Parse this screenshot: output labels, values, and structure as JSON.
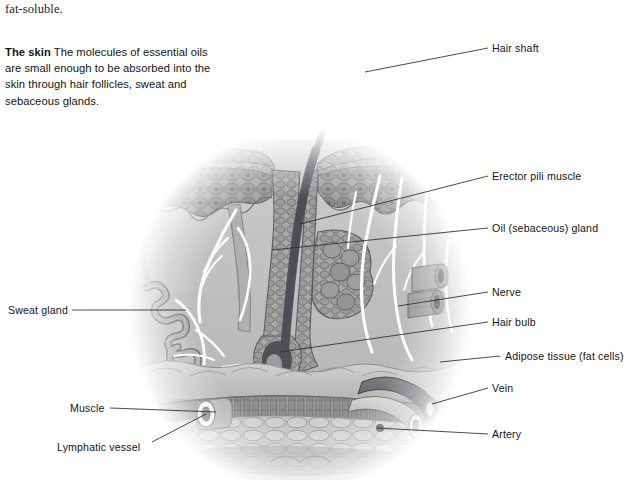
{
  "page": {
    "continuation_text": "fat-soluble.",
    "background_color": "#ffffff",
    "ink_color": "#141414"
  },
  "body_paragraph": {
    "lead_in": "The skin",
    "text": " The molecules of essential oils are small enough to be absorbed into the skin through hair follicles, sweat and sebaceous glands."
  },
  "figure": {
    "style": "grayscale medical illustration, circular vignette fading to white",
    "palette": {
      "epidermis_cells": "#8d8d8d",
      "dermis": "#b9b9b9",
      "hair_shaft": "#4f5055",
      "vessel_dark": "#5a5c61",
      "vessel_light": "#aeaeae",
      "nerve_white": "#fdfdfd",
      "muscle": "#9a9a9a",
      "adipose": "#c6c6c6"
    }
  },
  "labels": {
    "right": [
      {
        "id": "hair-shaft",
        "text": "Hair shaft"
      },
      {
        "id": "erector-pili",
        "text": "Erector pili muscle"
      },
      {
        "id": "oil-gland",
        "text": "Oil (sebaceous) gland"
      },
      {
        "id": "nerve",
        "text": "Nerve"
      },
      {
        "id": "hair-bulb",
        "text": "Hair bulb"
      },
      {
        "id": "adipose",
        "text": "Adipose tissue (fat cells)"
      },
      {
        "id": "vein",
        "text": "Vein"
      },
      {
        "id": "artery",
        "text": "Artery"
      }
    ],
    "left": [
      {
        "id": "sweat-gland",
        "text": "Sweat gland"
      },
      {
        "id": "muscle",
        "text": "Muscle"
      },
      {
        "id": "lymphatic-vessel",
        "text": "Lymphatic vessel"
      }
    ]
  }
}
